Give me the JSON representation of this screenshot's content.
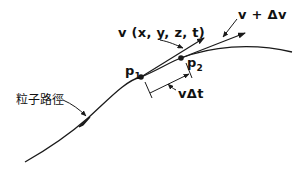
{
  "diagram": {
    "title": "",
    "labels": {
      "velocity": "v (x, y, z, t)",
      "velocity_plus": "v + Δv",
      "p1_main": "p",
      "p1_sub": "1",
      "p2_main": "p",
      "p2_sub": "2",
      "displacement": "vΔt",
      "path": "粒子路徑"
    },
    "colors": {
      "stroke": "#1a1a1a",
      "background": "#ffffff"
    },
    "nodes": [
      {
        "id": "p1",
        "label": "p1"
      },
      {
        "id": "p2",
        "label": "p2"
      }
    ],
    "edges": [
      {
        "from": "p1",
        "to": "velocity-tip",
        "label": "v (x, y, z, t)"
      },
      {
        "from": "p2",
        "to": "velocity-plus-tip",
        "label": "v + Δv"
      },
      {
        "from": "p1",
        "to": "p2",
        "label": "vΔt"
      }
    ]
  }
}
